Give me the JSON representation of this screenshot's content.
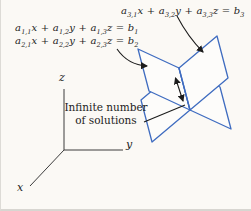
{
  "equations": [
    {
      "id": "eq1",
      "tokens": [
        "a",
        "_1,1",
        "x + ",
        "a",
        "_1,2",
        "y + ",
        "a",
        "_1,3",
        "z = ",
        "b",
        "_1"
      ]
    },
    {
      "id": "eq2",
      "tokens": [
        "a",
        "_2,1",
        "x + ",
        "a",
        "_2,2",
        "y + ",
        "a",
        "_2,3",
        "z = ",
        "b",
        "_2"
      ]
    },
    {
      "id": "eq3",
      "tokens": [
        "a",
        "_3,1",
        "x + ",
        "a",
        "_3,2",
        "y + ",
        "a",
        "_3,3",
        "z = ",
        "b",
        "_3"
      ]
    }
  ],
  "callout": {
    "line1": "Infinite number",
    "line2": "of solutions"
  },
  "axes": {
    "x": "x",
    "y": "y",
    "z": "z"
  },
  "colors": {
    "plane_outline": "#3f6cc0",
    "ink": "#1c1c1c",
    "axis": "#3c3c3c"
  }
}
